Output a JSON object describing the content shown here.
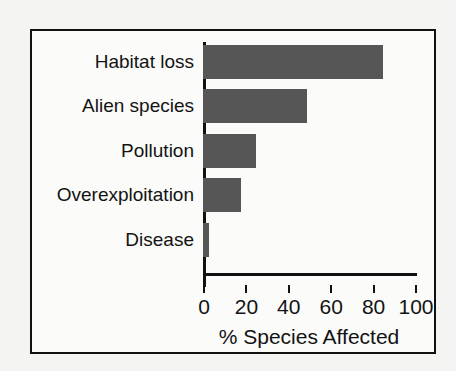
{
  "chart_data": {
    "type": "bar",
    "orientation": "horizontal",
    "title": "",
    "subtitle": "",
    "xlabel": "% Species Affected",
    "ylabel": "",
    "categories": [
      "Habitat loss",
      "Alien species",
      "Pollution",
      "Overexploitation",
      "Disease"
    ],
    "values": [
      85,
      49,
      25,
      18,
      3
    ],
    "series": [
      {
        "name": "% Species Affected",
        "values": [
          85,
          49,
          25,
          18,
          3
        ]
      }
    ],
    "xlim": [
      0,
      100
    ],
    "xticks": [
      0,
      20,
      40,
      60,
      80,
      100
    ],
    "xtick_labels": [
      "0",
      "20",
      "40",
      "60",
      "80",
      "100"
    ],
    "grid": false,
    "legend": false,
    "legend_position": "none",
    "bar_color": "#565656",
    "axis_color": "#111111",
    "text_color": "#131313",
    "background_color": "#fbfbfa",
    "frame_color": "#111111"
  }
}
